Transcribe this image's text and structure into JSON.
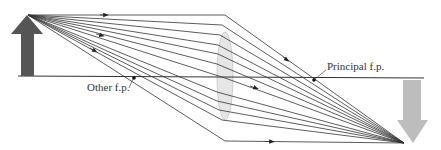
{
  "diagram": {
    "type": "thin converging lens ray diagram",
    "labels": {
      "principal_focal_point": "Principal f.p.",
      "other_focal_point": "Other f.p."
    },
    "colors": {
      "object_arrow": "#555555",
      "image_arrow": "#b8b8b8",
      "rays": "#333333",
      "axis": "#333333",
      "lens_fill": "#e4e4e4",
      "lens_stroke": "#c8c8c8"
    },
    "object": {
      "base": [
        27,
        76
      ],
      "tip": [
        33,
        15
      ],
      "direction": "up"
    },
    "image": {
      "base": [
        412,
        80
      ],
      "tip": [
        412,
        143
      ],
      "direction": "down"
    },
    "optical_axis": {
      "y": 76,
      "x_start": 18,
      "x_end": 424
    },
    "lens": {
      "cx": 225,
      "cy": 76,
      "rx": 8,
      "ry": 44
    },
    "focal_points": {
      "principal": [
        314,
        80
      ],
      "other": [
        134,
        78
      ]
    },
    "ray_source": [
      33,
      15
    ],
    "ray_target": [
      404,
      143
    ],
    "rays_lens_y": [
      16,
      24,
      36,
      46,
      56,
      66,
      80,
      92,
      102,
      112,
      121,
      140
    ]
  }
}
